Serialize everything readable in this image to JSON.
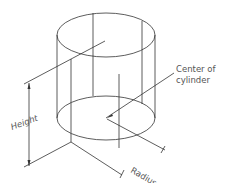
{
  "diagram": {
    "subject": "cylinder",
    "labels": {
      "height": "Height",
      "radius": "Radius",
      "center_line1": "Center of",
      "center_line2": "cylinder"
    },
    "colors": {
      "line": "#333333",
      "text": "#555555",
      "background": "#ffffff"
    }
  }
}
